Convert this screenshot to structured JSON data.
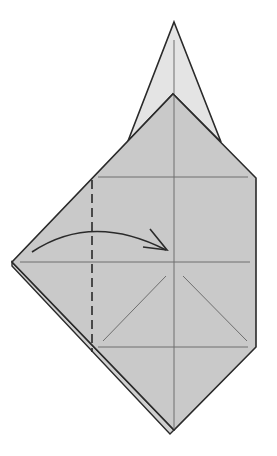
{
  "diagram": {
    "type": "origami-step",
    "colors": {
      "background": "#ffffff",
      "paper_front": "#c9c9c9",
      "paper_back_flap": "#e4e4e4",
      "outline": "#2a2a2a",
      "crease": "#6e6e6e"
    },
    "elements": {
      "top_flap": "pointed-flap",
      "main_body": "paper-body",
      "creases": [
        "vertical-center-crease",
        "horizontal-crease-upper",
        "horizontal-crease-middle",
        "horizontal-crease-lower",
        "diagonal-crease-left",
        "diagonal-crease-right"
      ],
      "fold_line": "valley-fold-dashed-line",
      "arrow": "fold-arrow"
    }
  }
}
